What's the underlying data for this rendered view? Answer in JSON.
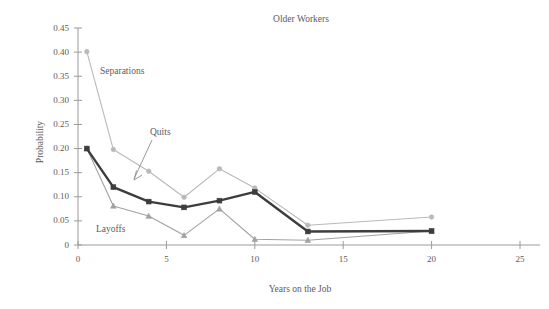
{
  "chart_data": {
    "type": "line",
    "title": "Older Workers",
    "xlabel": "Years on the Job",
    "ylabel": "Probability",
    "xlim": [
      0,
      25
    ],
    "ylim": [
      0,
      0.45
    ],
    "xticks": [
      "0",
      "5",
      "10",
      "15",
      "20",
      "25"
    ],
    "xtick_values": [
      0,
      5,
      10,
      15,
      20,
      25
    ],
    "yticks": [
      "0",
      "0.05",
      "0.10",
      "0.15",
      "0.20",
      "0.25",
      "0.30",
      "0.35",
      "0.40",
      "0.45"
    ],
    "ytick_values": [
      0,
      0.05,
      0.1,
      0.15,
      0.2,
      0.25,
      0.3,
      0.35,
      0.4,
      0.45
    ],
    "grid": false,
    "legend": "inline-annotations",
    "x": [
      0.5,
      2,
      4,
      6,
      8,
      10,
      13,
      20
    ],
    "series": [
      {
        "name": "Separations",
        "color": "#b9b9b9",
        "marker": "circle",
        "values": [
          0.401,
          0.198,
          0.153,
          0.099,
          0.158,
          0.118,
          0.041,
          0.058
        ]
      },
      {
        "name": "Quits",
        "color": "#3d3d3d",
        "marker": "square",
        "values": [
          0.2,
          0.12,
          0.09,
          0.078,
          0.092,
          0.11,
          0.028,
          0.029
        ]
      },
      {
        "name": "Layoffs",
        "color": "#a2a2a2",
        "marker": "triangle",
        "values": [
          0.2,
          0.081,
          0.06,
          0.02,
          0.075,
          0.012,
          0.01,
          0.029
        ]
      }
    ],
    "annotations": [
      {
        "text": "Separations",
        "x_px": 100,
        "y_px": 74
      },
      {
        "text": "Quits",
        "x_px": 150,
        "y_px": 135
      },
      {
        "text": "Layoffs",
        "x_px": 96,
        "y_px": 232
      }
    ]
  },
  "colors": {
    "axis": "#9a9a9a",
    "text": "#5b5b5b",
    "separations": "#b9b9b9",
    "quits": "#3d3d3d",
    "layoffs": "#a2a2a2",
    "background": "#ffffff"
  }
}
